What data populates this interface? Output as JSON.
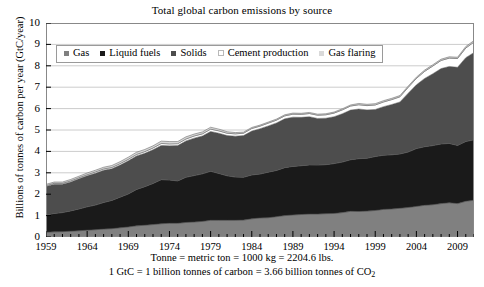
{
  "chart_data": {
    "type": "area",
    "title": "Total global carbon emissions by source",
    "xlabel": "",
    "ylabel": "Billions of tonnes of carbon per year (GtC/year)",
    "stacked": true,
    "grid": true,
    "legend_position": "top-left-inside",
    "xlim": [
      1959,
      2011
    ],
    "ylim": [
      0,
      10
    ],
    "ytick_labels": [
      "0",
      "1",
      "2",
      "3",
      "4",
      "5",
      "6",
      "7",
      "8",
      "9",
      "10"
    ],
    "ytick_values": [
      0,
      1,
      2,
      3,
      4,
      5,
      6,
      7,
      8,
      9,
      10
    ],
    "xtick_labels": [
      "1959",
      "1964",
      "1969",
      "1974",
      "1979",
      "1984",
      "1989",
      "1994",
      "1999",
      "2004",
      "2009"
    ],
    "xtick_values": [
      1959,
      1964,
      1969,
      1974,
      1979,
      1984,
      1989,
      1994,
      1999,
      2004,
      2009
    ],
    "x": [
      1959,
      1960,
      1961,
      1962,
      1963,
      1964,
      1965,
      1966,
      1967,
      1968,
      1969,
      1970,
      1971,
      1972,
      1973,
      1974,
      1975,
      1976,
      1977,
      1978,
      1979,
      1980,
      1981,
      1982,
      1983,
      1984,
      1985,
      1986,
      1987,
      1988,
      1989,
      1990,
      1991,
      1992,
      1993,
      1994,
      1995,
      1996,
      1997,
      1998,
      1999,
      2000,
      2001,
      2002,
      2003,
      2004,
      2005,
      2006,
      2007,
      2008,
      2009,
      2010,
      2011
    ],
    "series": [
      {
        "name": "Gas",
        "color": "#808080",
        "values": [
          0.22,
          0.24,
          0.25,
          0.27,
          0.29,
          0.32,
          0.34,
          0.37,
          0.39,
          0.43,
          0.47,
          0.52,
          0.55,
          0.58,
          0.62,
          0.64,
          0.64,
          0.68,
          0.7,
          0.73,
          0.78,
          0.78,
          0.78,
          0.78,
          0.79,
          0.85,
          0.89,
          0.9,
          0.95,
          1.0,
          1.03,
          1.05,
          1.07,
          1.07,
          1.09,
          1.1,
          1.14,
          1.2,
          1.19,
          1.21,
          1.24,
          1.29,
          1.31,
          1.34,
          1.38,
          1.43,
          1.48,
          1.51,
          1.56,
          1.6,
          1.56,
          1.67,
          1.72
        ]
      },
      {
        "name": "Liquid fuels",
        "color": "#1a1a1a",
        "values": [
          0.81,
          0.86,
          0.89,
          0.95,
          1.02,
          1.09,
          1.15,
          1.24,
          1.32,
          1.43,
          1.54,
          1.7,
          1.8,
          1.92,
          2.06,
          2.02,
          1.98,
          2.11,
          2.17,
          2.22,
          2.29,
          2.19,
          2.08,
          2.02,
          2.0,
          2.05,
          2.05,
          2.13,
          2.16,
          2.24,
          2.27,
          2.28,
          2.3,
          2.29,
          2.29,
          2.33,
          2.36,
          2.41,
          2.47,
          2.47,
          2.52,
          2.53,
          2.53,
          2.54,
          2.59,
          2.7,
          2.74,
          2.76,
          2.79,
          2.77,
          2.72,
          2.79,
          2.82
        ]
      },
      {
        "name": "Solids",
        "color": "#4d4d4d",
        "values": [
          1.33,
          1.37,
          1.33,
          1.35,
          1.41,
          1.45,
          1.49,
          1.51,
          1.48,
          1.5,
          1.55,
          1.57,
          1.56,
          1.58,
          1.6,
          1.6,
          1.65,
          1.7,
          1.75,
          1.77,
          1.86,
          1.88,
          1.88,
          1.91,
          1.95,
          2.05,
          2.12,
          2.16,
          2.22,
          2.28,
          2.3,
          2.26,
          2.25,
          2.18,
          2.17,
          2.19,
          2.26,
          2.32,
          2.32,
          2.26,
          2.2,
          2.27,
          2.35,
          2.43,
          2.75,
          2.98,
          3.19,
          3.36,
          3.52,
          3.6,
          3.65,
          3.92,
          4.08
        ]
      },
      {
        "name": "Cement production",
        "color": "#ffffff",
        "values": [
          0.04,
          0.04,
          0.04,
          0.05,
          0.05,
          0.05,
          0.06,
          0.06,
          0.06,
          0.07,
          0.07,
          0.07,
          0.08,
          0.08,
          0.09,
          0.09,
          0.09,
          0.09,
          0.1,
          0.1,
          0.11,
          0.11,
          0.11,
          0.11,
          0.11,
          0.12,
          0.12,
          0.13,
          0.13,
          0.14,
          0.14,
          0.14,
          0.15,
          0.15,
          0.16,
          0.17,
          0.18,
          0.19,
          0.2,
          0.2,
          0.21,
          0.22,
          0.23,
          0.24,
          0.27,
          0.3,
          0.33,
          0.36,
          0.38,
          0.39,
          0.41,
          0.45,
          0.49
        ]
      },
      {
        "name": "Gas flaring",
        "color": "#d9d9d9",
        "values": [
          0.06,
          0.06,
          0.06,
          0.07,
          0.07,
          0.08,
          0.08,
          0.08,
          0.09,
          0.09,
          0.1,
          0.1,
          0.1,
          0.1,
          0.11,
          0.11,
          0.1,
          0.1,
          0.09,
          0.09,
          0.09,
          0.08,
          0.07,
          0.06,
          0.05,
          0.05,
          0.05,
          0.05,
          0.05,
          0.05,
          0.05,
          0.05,
          0.05,
          0.05,
          0.05,
          0.05,
          0.05,
          0.05,
          0.06,
          0.06,
          0.06,
          0.06,
          0.06,
          0.06,
          0.06,
          0.06,
          0.06,
          0.06,
          0.06,
          0.06,
          0.06,
          0.07,
          0.07
        ]
      }
    ],
    "totals": [
      2.46,
      2.57,
      2.57,
      2.69,
      2.84,
      2.99,
      3.12,
      3.26,
      3.34,
      3.52,
      3.73,
      3.96,
      4.09,
      4.26,
      4.48,
      4.46,
      4.46,
      4.68,
      4.81,
      4.91,
      5.13,
      5.04,
      4.92,
      4.88,
      4.9,
      5.12,
      5.23,
      5.37,
      5.51,
      5.71,
      5.79,
      5.78,
      5.82,
      5.74,
      5.76,
      5.84,
      5.99,
      6.17,
      6.24,
      6.2,
      6.23,
      6.37,
      6.48,
      6.61,
      7.05,
      7.47,
      7.8,
      8.05,
      8.31,
      8.42,
      8.4,
      8.9,
      9.18
    ],
    "annotations": [
      "Tonne = metric ton = 1000 kg = 2204.6 lbs.",
      "1 GtC = 1 billion tonnes of carbon = 3.66 billion tonnes of CO2"
    ]
  },
  "footnotes": {
    "line1": "Tonne = metric ton = 1000 kg = 2204.6 lbs.",
    "line2_pre": "1 GtC = 1 billion tonnes of carbon = 3.66 billion tonnes of CO",
    "line2_sub": "2"
  },
  "colors": {
    "axis": "#000000",
    "grid": "#cccccc",
    "plot_border": "#888888",
    "background": "#ffffff",
    "legend_border": "#9a9a9a"
  }
}
